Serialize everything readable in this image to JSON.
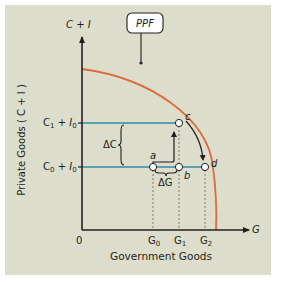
{
  "figure": {
    "y_axis_title": "C + I",
    "y_axis_label": "Private Goods ( C + I )",
    "x_axis_title": "G",
    "x_axis_label": "Government Goods",
    "origin_label": "0",
    "curve_label": "PPF",
    "colors": {
      "background": "#dcdecb",
      "ppf_curve": "#e0693c",
      "level_lines": "#5aa0b0",
      "axes": "#231f20"
    },
    "y_levels": [
      {
        "id": "upper",
        "label_main": "C",
        "label_sub1": "1",
        "label_mid": " + I",
        "label_sub2": "0"
      },
      {
        "id": "lower",
        "label_main": "C",
        "label_sub1": "0",
        "label_mid": " + I",
        "label_sub2": "0"
      }
    ],
    "x_ticks": [
      {
        "main": "G",
        "sub": "0"
      },
      {
        "main": "G",
        "sub": "1"
      },
      {
        "main": "G",
        "sub": "2"
      }
    ],
    "points": [
      {
        "name": "a"
      },
      {
        "name": "b"
      },
      {
        "name": "c"
      },
      {
        "name": "d"
      }
    ],
    "delta_c_label": "ΔC",
    "delta_g_label": "ΔG"
  }
}
